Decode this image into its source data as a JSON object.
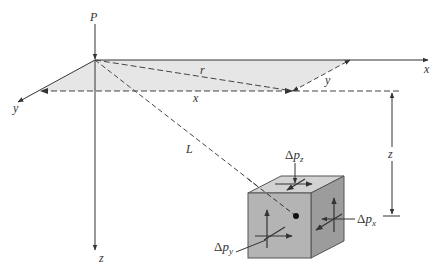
{
  "diagram": {
    "load_label": "P",
    "axes": {
      "x": "x",
      "y": "y",
      "z": "z"
    },
    "distances": {
      "r": "r",
      "x": "x",
      "y": "y",
      "L": "L",
      "z": "z"
    },
    "stresses": {
      "dpz": {
        "delta": "Δ",
        "p": "p",
        "sub": "z"
      },
      "dpx": {
        "delta": "Δ",
        "p": "p",
        "sub": "x"
      },
      "dpy": {
        "delta": "Δ",
        "p": "p",
        "sub": "y"
      }
    }
  },
  "colors": {
    "plane_fill": "#e6e6e6",
    "cube_front": "#b4b4b4",
    "cube_top": "#d2d2d2",
    "cube_side": "#9c9c9c",
    "line": "#333333"
  }
}
